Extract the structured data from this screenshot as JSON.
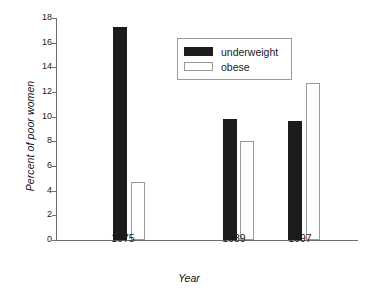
{
  "chart_data": {
    "type": "bar",
    "title": "",
    "xlabel": "Year",
    "ylabel": "Percent of poor women",
    "categories": [
      "1975",
      "1989",
      "1997"
    ],
    "series": [
      {
        "name": "underweight",
        "values": [
          17.3,
          9.8,
          9.65
        ],
        "color": "#1c1c1c"
      },
      {
        "name": "obese",
        "values": [
          4.7,
          8.0,
          12.7
        ],
        "color": "#ffffff"
      }
    ],
    "ylim": [
      0,
      18
    ],
    "ytick_step": 2,
    "yticks": [
      "18",
      "16",
      "14",
      "12",
      "10",
      "8",
      "6",
      "4",
      "2",
      "0"
    ],
    "grid": false,
    "legend_position": "upper-center",
    "axis_color": "#6e6e6e",
    "outline_color": "#9a9a9a"
  },
  "legend": {
    "entries": [
      {
        "label": "underweight"
      },
      {
        "label": "obese"
      }
    ]
  }
}
